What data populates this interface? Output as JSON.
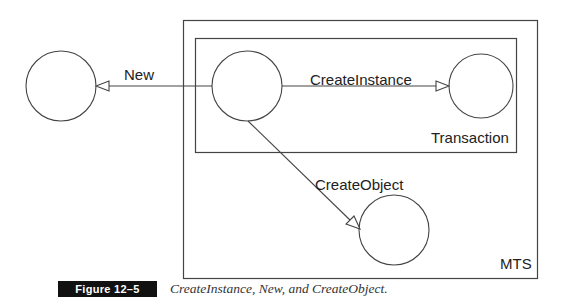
{
  "diagram": {
    "containers": {
      "outer": {
        "label": "MTS"
      },
      "inner": {
        "label": "Transaction"
      }
    },
    "nodes": [
      {
        "id": "client",
        "label": ""
      },
      {
        "id": "root",
        "label": ""
      },
      {
        "id": "instance",
        "label": ""
      },
      {
        "id": "object",
        "label": ""
      }
    ],
    "edges": [
      {
        "from": "root",
        "to": "client",
        "label": "New"
      },
      {
        "from": "root",
        "to": "instance",
        "label": "CreateInstance"
      },
      {
        "from": "root",
        "to": "object",
        "label": "CreateObject"
      }
    ]
  },
  "figure": {
    "number_label": "Figure 12–5",
    "caption": "CreateInstance, New, and CreateObject."
  }
}
